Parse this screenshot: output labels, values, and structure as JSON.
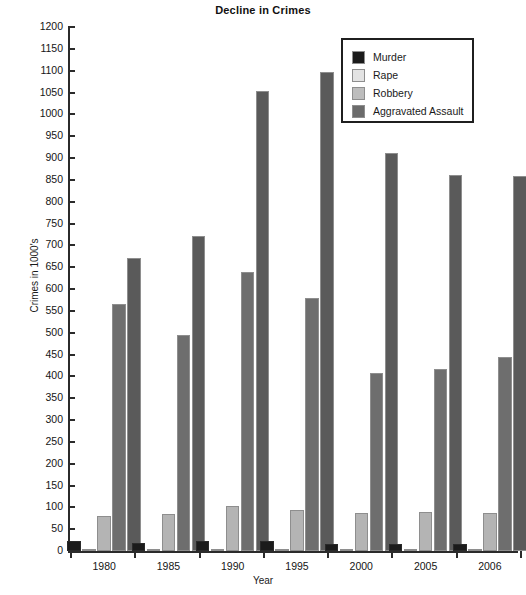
{
  "chart_data": {
    "type": "bar",
    "title": "Decline in Crimes",
    "xlabel": "Year",
    "ylabel": "Crimes in 1000's",
    "categories": [
      "1980",
      "1985",
      "1990",
      "1995",
      "2000",
      "2005",
      "2006"
    ],
    "ylim": [
      0,
      1200
    ],
    "ytick_step": 50,
    "yticks": [
      0,
      50,
      100,
      150,
      200,
      250,
      300,
      350,
      400,
      450,
      500,
      550,
      600,
      650,
      700,
      750,
      800,
      850,
      900,
      950,
      1000,
      1050,
      1100,
      1150,
      1200
    ],
    "grid": false,
    "legend_position": "top-right",
    "series": [
      {
        "name": "Murder",
        "color": "#1b1b1b",
        "values": [
          23,
          19,
          23,
          22,
          16,
          16,
          17
        ]
      },
      {
        "name": "Rape",
        "color": "#e0e0e0",
        "values": [
          3,
          4,
          4,
          4,
          3,
          3,
          3
        ]
      },
      {
        "name": "Robbery",
        "color": "#b4b4b4",
        "values": [
          80,
          85,
          102,
          95,
          87,
          90,
          88
        ]
      },
      {
        "name": "Aggravated Assault",
        "color": "#6e6e6e",
        "values": [
          565,
          495,
          640,
          580,
          408,
          417,
          445
        ]
      }
    ],
    "extra_series": [
      {
        "name": "Aggravated Assault Tall",
        "color": "#5a5a5a",
        "values": [
          670,
          722,
          1053,
          1098,
          911,
          860,
          859
        ]
      }
    ]
  },
  "legend": {
    "items": [
      {
        "label": "Murder",
        "color": "#1b1b1b"
      },
      {
        "label": "Rape",
        "color": "#e3e3e3"
      },
      {
        "label": "Robbery",
        "color": "#bdbdbd"
      },
      {
        "label": "Aggravated Assault",
        "color": "#6b6b6b"
      }
    ]
  }
}
